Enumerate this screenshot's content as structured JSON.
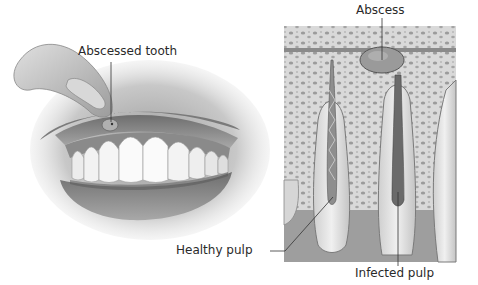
{
  "figure": {
    "left_panel": {
      "subject": "mouth with finger lifting upper lip",
      "labels": {
        "abscessed_tooth": "Abscessed tooth"
      }
    },
    "right_panel": {
      "subject": "cross-section of teeth and jaw bone",
      "labels": {
        "abscess": "Abscess",
        "healthy_pulp": "Healthy pulp",
        "infected_pulp": "Infected pulp"
      }
    }
  }
}
